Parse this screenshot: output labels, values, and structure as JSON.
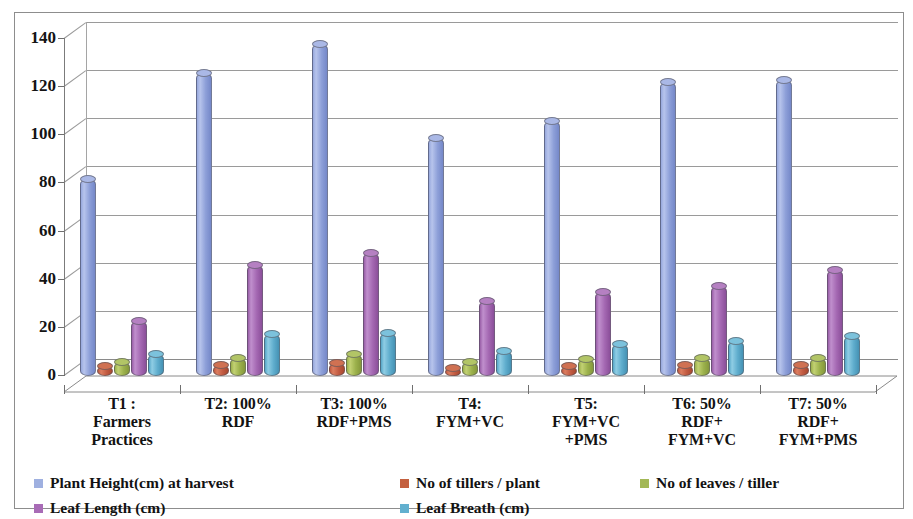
{
  "chart_data": {
    "type": "bar",
    "title": "",
    "subtitle": "",
    "xlabel": "",
    "ylabel": "",
    "ylim": [
      0,
      140
    ],
    "ytick_step": 20,
    "yticks": [
      "0",
      "20",
      "40",
      "60",
      "80",
      "100",
      "120",
      "140"
    ],
    "grid": true,
    "legend_position": "bottom",
    "three_d": true,
    "categories": [
      "T1 :\nFarmers\nPractices",
      "T2: 100%\nRDF",
      "T3: 100%\nRDF+PMS",
      "T4:\nFYM+VC",
      "T5:\nFYM+VC\n+PMS",
      "T6: 50%\nRDF+\nFYM+VC",
      "T7: 50%\nRDF+\nFYM+PMS"
    ],
    "category_lines": [
      [
        "T1 :",
        "Farmers",
        "Practices"
      ],
      [
        "T2: 100%",
        "RDF"
      ],
      [
        "T3: 100%",
        "RDF+PMS"
      ],
      [
        "T4:",
        "FYM+VC"
      ],
      [
        "T5:",
        "FYM+VC",
        "+PMS"
      ],
      [
        "T6: 50%",
        "RDF+",
        "FYM+VC"
      ],
      [
        "T7: 50%",
        "RDF+",
        "FYM+PMS"
      ]
    ],
    "series": [
      {
        "name": "Plant Height(cm) at harvest",
        "color": "#9fb0e0",
        "values": [
          82,
          126,
          138,
          99,
          106,
          122,
          123
        ]
      },
      {
        "name": "No of tillers / plant",
        "color": "#c4603f",
        "values": [
          4,
          4.5,
          5.5,
          3.5,
          4,
          4.5,
          4.5
        ]
      },
      {
        "name": "No of leaves / tiller",
        "color": "#a3b856",
        "values": [
          6,
          7.5,
          9,
          6,
          7,
          7.5,
          7.5
        ]
      },
      {
        "name": "Leaf Length (cm)",
        "color": "#a86bb6",
        "values": [
          23,
          46,
          51,
          31,
          35,
          37.5,
          44
        ]
      },
      {
        "name": "Leaf Breath (cm)",
        "color": "#62b0cf",
        "values": [
          9,
          17.5,
          18,
          10.5,
          13.5,
          14.5,
          16.5
        ]
      }
    ],
    "legend_entries": [
      {
        "label": "Plant Height(cm) at harvest",
        "color": "#9fb0e0"
      },
      {
        "label": "No of tillers / plant",
        "color": "#c4603f"
      },
      {
        "label": "No of leaves / tiller",
        "color": "#a3b856"
      },
      {
        "label": "Leaf Length (cm)",
        "color": "#a86bb6"
      },
      {
        "label": "Leaf Breath (cm)",
        "color": "#62b0cf"
      }
    ]
  }
}
